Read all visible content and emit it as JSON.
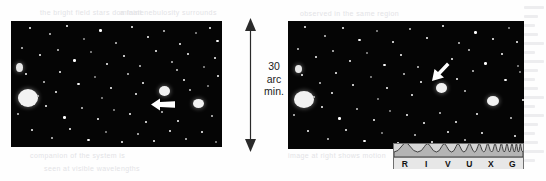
{
  "figure": {
    "kind": "astronomical-image-pair",
    "background_color": "#ffffff",
    "sky_color": "#050505"
  },
  "scale_bar": {
    "name": "angular-scale-indicator",
    "arrow_style": "double-headed-vertical",
    "lines": [
      "30",
      "arc",
      "min."
    ],
    "value": "30",
    "unit_line_1": "arc",
    "unit_line_2": "min.",
    "full_text": "30 arc min.",
    "color": "#1b1b1b"
  },
  "panels": [
    {
      "name": "left-sky-panel",
      "caption": "",
      "pointer": {
        "name": "object-pointer-arrow",
        "direction": "left"
      }
    },
    {
      "name": "right-sky-panel",
      "caption": "",
      "pointer": {
        "name": "object-pointer-arrow",
        "direction": "down-left"
      }
    }
  ],
  "spectrum_bar": {
    "name": "rivuxg-waveband-bar",
    "letters": [
      "R",
      "I",
      "V",
      "U",
      "X",
      "G"
    ],
    "highlighted": "V",
    "bar_color": "#d6d6d6",
    "letter_strip_color": "#e7e7e7",
    "border_color": "#6f6f6f"
  },
  "bleed_through": {
    "line_a": "the bright field stars dominate",
    "line_b": "a faint nebulosity surrounds",
    "line_c": "companion of the system is",
    "line_d": "seen at visible wavelengths",
    "line_e": "observed in the same region",
    "line_f": "image at right shows motion"
  }
}
